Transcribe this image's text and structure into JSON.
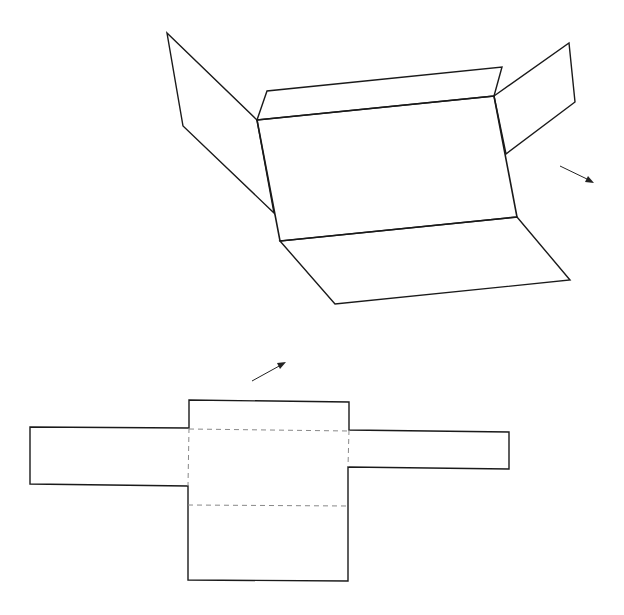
{
  "diagram": {
    "colors": {
      "line": "#1a1a1a",
      "fold": "#888888",
      "background": "#ffffff"
    },
    "folded_box": {
      "main_face": [
        [
          257,
          120
        ],
        [
          494,
          96
        ],
        [
          517,
          217
        ],
        [
          280,
          241
        ]
      ],
      "top_flap": [
        [
          257,
          120
        ],
        [
          267,
          91
        ],
        [
          502,
          67
        ],
        [
          494,
          96
        ]
      ],
      "left_flap": [
        [
          257,
          120
        ],
        [
          167,
          33
        ],
        [
          183,
          126
        ],
        [
          274,
          213
        ]
      ],
      "right_flap": [
        [
          494,
          96
        ],
        [
          569,
          43
        ],
        [
          575,
          102
        ],
        [
          506,
          154
        ]
      ],
      "bottom_flap": [
        [
          280,
          241
        ],
        [
          335,
          304
        ],
        [
          570,
          280
        ],
        [
          517,
          217
        ]
      ]
    },
    "arrows": [
      {
        "name": "rotate-arrow-right",
        "from": [
          560,
          166
        ],
        "to": [
          593,
          182
        ]
      },
      {
        "name": "unfold-arrow",
        "from": [
          252,
          381
        ],
        "to": [
          285,
          363
        ]
      }
    ],
    "flat_net": {
      "outline": [
        [
          189,
          400
        ],
        [
          349,
          402
        ],
        [
          349,
          430
        ],
        [
          509,
          432
        ],
        [
          509,
          469
        ],
        [
          348,
          467
        ],
        [
          348,
          581
        ],
        [
          188,
          580
        ],
        [
          188,
          486
        ],
        [
          30,
          484
        ],
        [
          30,
          427
        ],
        [
          189,
          428
        ]
      ],
      "fold_lines": [
        {
          "from": [
            189,
            429
          ],
          "to": [
            349,
            431
          ]
        },
        {
          "from": [
            188,
            505
          ],
          "to": [
            348,
            506
          ]
        },
        {
          "from": [
            189,
            428
          ],
          "to": [
            188,
            486
          ]
        },
        {
          "from": [
            349,
            430
          ],
          "to": [
            348,
            467
          ]
        }
      ]
    }
  }
}
